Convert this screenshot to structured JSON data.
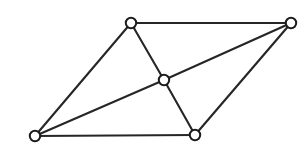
{
  "diagram": {
    "type": "undirected-graph",
    "canvas": {
      "width": 306,
      "height": 147,
      "background_color": "#ffffff"
    },
    "style": {
      "edge_color": "#262626",
      "edge_width": 2.1,
      "vertex_fill": "#ffffff",
      "vertex_stroke": "#1c1c1c",
      "vertex_stroke_width": 2.0,
      "vertex_radius": 5.2
    },
    "vertex_count": 5,
    "edge_count": 8,
    "vertices": [
      {
        "id": "top-left",
        "label": "",
        "x": 131,
        "y": 23,
        "degree": 3
      },
      {
        "id": "top-right",
        "label": "",
        "x": 291,
        "y": 23,
        "degree": 3
      },
      {
        "id": "center",
        "label": "",
        "x": 164,
        "y": 80,
        "degree": 4
      },
      {
        "id": "bottom-left",
        "label": "",
        "x": 35,
        "y": 136,
        "degree": 3
      },
      {
        "id": "bottom-right",
        "label": "",
        "x": 195,
        "y": 135,
        "degree": 3
      }
    ],
    "edges": [
      {
        "id": "edge-top",
        "from": "top-left",
        "to": "top-right",
        "x1": 131,
        "y1": 23,
        "x2": 291,
        "y2": 23
      },
      {
        "id": "edge-topleft-center",
        "from": "top-left",
        "to": "center",
        "x1": 131,
        "y1": 23,
        "x2": 164,
        "y2": 80
      },
      {
        "id": "edge-left",
        "from": "top-left",
        "to": "bottom-left",
        "x1": 131,
        "y1": 23,
        "x2": 35,
        "y2": 136
      },
      {
        "id": "edge-center-topright",
        "from": "center",
        "to": "top-right",
        "x1": 164,
        "y1": 80,
        "x2": 291,
        "y2": 23
      },
      {
        "id": "edge-right",
        "from": "top-right",
        "to": "bottom-right",
        "x1": 291,
        "y1": 23,
        "x2": 195,
        "y2": 135
      },
      {
        "id": "edge-bottomleft-center",
        "from": "bottom-left",
        "to": "center",
        "x1": 35,
        "y1": 136,
        "x2": 164,
        "y2": 80
      },
      {
        "id": "edge-center-bottomright",
        "from": "center",
        "to": "bottom-right",
        "x1": 164,
        "y1": 80,
        "x2": 195,
        "y2": 135
      },
      {
        "id": "edge-bottom",
        "from": "bottom-left",
        "to": "bottom-right",
        "x1": 35,
        "y1": 136,
        "x2": 195,
        "y2": 135
      }
    ]
  }
}
